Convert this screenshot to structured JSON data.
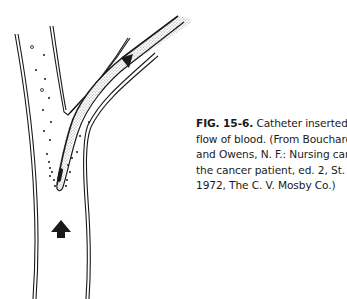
{
  "figure": {
    "label": "FIG. 15-6.",
    "caption_lines": [
      " Catheter inserted against",
      "flow of blood. (From Bouchard, R.,",
      "and Owens, N. F.: Nursing care of",
      "the cancer patient, ed. 2, St. Louis,",
      "1972, The C. V. Mosby Co.)"
    ],
    "illustration": "vessel-with-catheter",
    "colors": {
      "ink": "#1a1a1a",
      "stipple": "#bdbdbd",
      "paper": "#ffffff"
    }
  }
}
